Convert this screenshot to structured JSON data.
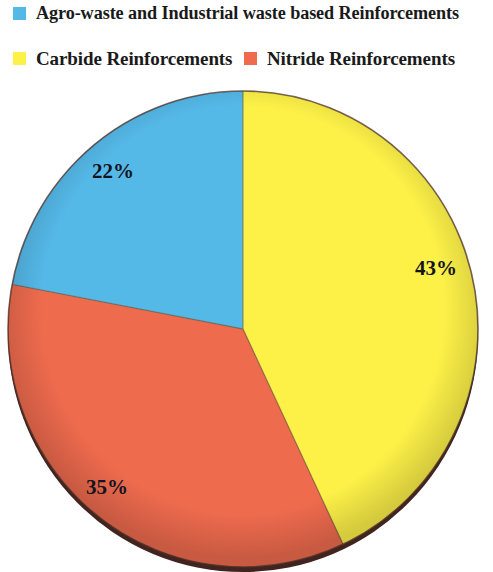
{
  "legend": {
    "items": [
      {
        "label": "Agro-waste and Industrial waste based Reinforcements",
        "color": "#55b9e8",
        "swatch_name": "legend-swatch-agro-waste"
      },
      {
        "label": "Carbide Reinforcements",
        "color": "#fdf148",
        "swatch_name": "legend-swatch-carbide"
      },
      {
        "label": "Nitride Reinforcements",
        "color": "#ef6b4e",
        "swatch_name": "legend-swatch-nitride"
      }
    ]
  },
  "labels": {
    "yellow": "43%",
    "red": "35%",
    "blue": "22%"
  },
  "chart_data": {
    "type": "pie",
    "title": "",
    "categories": [
      "Carbide Reinforcements",
      "Nitride Reinforcements",
      "Agro-waste and Industrial waste based Reinforcements"
    ],
    "values": [
      43,
      35,
      22
    ],
    "value_unit": "%",
    "data_labels": [
      "43%",
      "35%",
      "22%"
    ],
    "colors": [
      "#fdf148",
      "#ef6b4e",
      "#55b9e8"
    ],
    "legend_position": "top",
    "start_angle_deg": 0,
    "direction": "clockwise",
    "grid": false,
    "shadow_color": "#41241f",
    "background": "#ffffff"
  }
}
